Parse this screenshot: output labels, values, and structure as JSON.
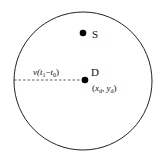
{
  "diagram": {
    "boundary": {
      "cx": 83,
      "cy": 81,
      "r": 69
    },
    "nodes": [
      {
        "id": "S",
        "label": "S",
        "x": 83,
        "y": 33
      },
      {
        "id": "D",
        "label": "D",
        "x": 85,
        "y": 80,
        "coord_label_x": "x",
        "coord_sub_x": "d",
        "coord_sep": ", ",
        "coord_label_y": "y",
        "coord_sub_y": "d"
      }
    ],
    "radius_label": {
      "v": "v(",
      "t1": "t",
      "t1_sub": "1",
      "minus": "−",
      "t0": "t",
      "t0_sub": "0",
      "close": ")"
    }
  }
}
